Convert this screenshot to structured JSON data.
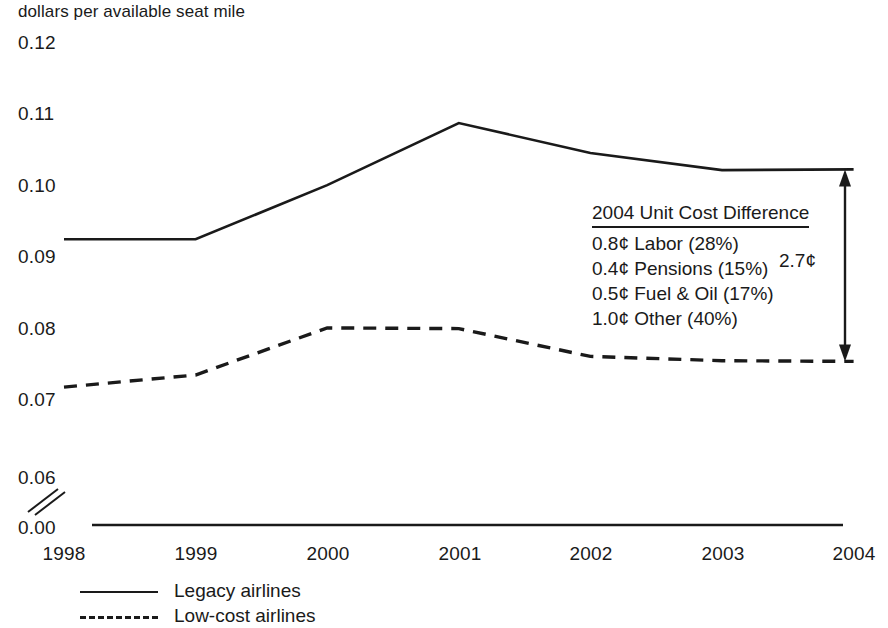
{
  "chart_data": {
    "type": "line",
    "title": "dollars per available seat mile",
    "xlabel": "",
    "ylabel": "dollars per available seat mile",
    "x": [
      "1998",
      "1999",
      "2000",
      "2001",
      "2002",
      "2003",
      "2004"
    ],
    "categories": [
      "1998",
      "1999",
      "2000",
      "2001",
      "2002",
      "2003",
      "2004"
    ],
    "series": [
      {
        "name": "Legacy airlines",
        "style": "solid",
        "values": [
          0.0925,
          0.0925,
          0.1001,
          0.1088,
          0.1046,
          0.1022,
          0.1023
        ]
      },
      {
        "name": "Low-cost airlines",
        "style": "dashed",
        "values": [
          0.0718,
          0.0735,
          0.0801,
          0.08,
          0.0761,
          0.0755,
          0.0754
        ]
      }
    ],
    "ylim": [
      0.06,
      0.12
    ],
    "yticks": [
      "0.12",
      "0.11",
      "0.10",
      "0.09",
      "0.08",
      "0.07",
      "0.06",
      "0.00"
    ],
    "ytick_values": [
      0.12,
      0.11,
      0.1,
      0.09,
      0.08,
      0.07,
      0.06,
      0.0
    ],
    "xticks": [
      "1998",
      "1999",
      "2000",
      "2001",
      "2002",
      "2003",
      "2004"
    ],
    "grid": false,
    "axis_break": true,
    "axis_break_between": [
      "0.06",
      "0.00"
    ],
    "legend_position": "bottom-left",
    "line_color": "#1a1a1a",
    "background_color": "#ffffff"
  },
  "axis_title": "dollars per available seat mile",
  "y_axis": {
    "ticks": [
      {
        "label": "0.12"
      },
      {
        "label": "0.11"
      },
      {
        "label": "0.10"
      },
      {
        "label": "0.09"
      },
      {
        "label": "0.08"
      },
      {
        "label": "0.07"
      },
      {
        "label": "0.06"
      },
      {
        "label": "0.00"
      }
    ]
  },
  "x_axis": {
    "ticks": [
      {
        "label": "1998"
      },
      {
        "label": "1999"
      },
      {
        "label": "2000"
      },
      {
        "label": "2001"
      },
      {
        "label": "2002"
      },
      {
        "label": "2003"
      },
      {
        "label": "2004"
      }
    ]
  },
  "annotation": {
    "title": "2004 Unit Cost Difference",
    "rows": [
      {
        "text": "0.8¢ Labor (28%)"
      },
      {
        "text": "0.4¢ Pensions (15%)"
      },
      {
        "text": "0.5¢ Fuel & Oil (17%)"
      },
      {
        "text": "1.0¢ Other (40%)"
      }
    ],
    "difference_label": "2.7¢"
  },
  "legend": {
    "items": [
      {
        "label": "Legacy airlines",
        "style": "solid"
      },
      {
        "label": "Low-cost airlines",
        "style": "dashed"
      }
    ]
  }
}
